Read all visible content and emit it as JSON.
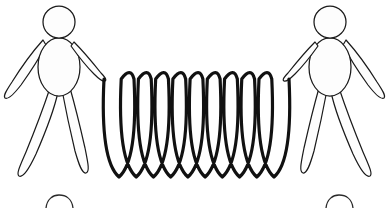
{
  "canvas": {
    "width": 389,
    "height": 208,
    "background_color": "#ffffff",
    "title": "Two figures stretching a coiled spring"
  },
  "style": {
    "outline_color": "#1a1a1a",
    "fill_color": "#fdfdfd",
    "spring_color": "#111111",
    "spring_stroke_width": 3.2,
    "figure_stroke_width": 1.25
  },
  "figures": [
    {
      "id": "left-figure",
      "label": "Left figure",
      "facing": "right",
      "head": {
        "cx": 59,
        "cy": 22,
        "rx": 16,
        "ry": 16
      },
      "torso": {
        "cx": 59,
        "cy": 67,
        "rx": 21,
        "ry": 29
      },
      "arms": [
        {
          "id": "left-figure-far-arm",
          "label": "Far arm",
          "direction": "down-left"
        },
        {
          "id": "left-figure-near-arm",
          "label": "Near arm holding spring",
          "direction": "down-right",
          "holds_spring": true
        }
      ],
      "legs": [
        {
          "id": "left-figure-left-leg",
          "label": "Left leg",
          "direction": "down-left"
        },
        {
          "id": "left-figure-right-leg",
          "label": "Right leg",
          "direction": "down-right"
        }
      ],
      "hand_anchor": {
        "x": 105,
        "y": 80
      }
    },
    {
      "id": "right-figure",
      "label": "Right figure",
      "facing": "left",
      "head": {
        "cx": 330,
        "cy": 22,
        "rx": 16,
        "ry": 16
      },
      "torso": {
        "cx": 330,
        "cy": 67,
        "rx": 21,
        "ry": 29
      },
      "arms": [
        {
          "id": "right-figure-far-arm",
          "label": "Far arm",
          "direction": "down-right"
        },
        {
          "id": "right-figure-near-arm",
          "label": "Near arm holding spring",
          "direction": "down-left",
          "holds_spring": true
        }
      ],
      "legs": [
        {
          "id": "right-figure-left-leg",
          "label": "Left leg",
          "direction": "down-left"
        },
        {
          "id": "right-figure-right-leg",
          "label": "Right leg",
          "direction": "down-right"
        }
      ],
      "hand_anchor": {
        "x": 288,
        "y": 80
      }
    }
  ],
  "spring": {
    "id": "spring-coil",
    "label": "Coiled spring",
    "loop_count": 10,
    "x_start": 104,
    "x_end": 289,
    "y_top": 79,
    "y_bottom": 177,
    "loop_pitch": 20.5,
    "loop_width": 30,
    "color": "#111111"
  },
  "partial_heads": [
    {
      "id": "partial-head-left",
      "label": "Top of head below crop (left)",
      "cx": 59,
      "cy": 212,
      "rx": 14,
      "ry": 12
    },
    {
      "id": "partial-head-right",
      "label": "Top of head below crop (right)",
      "cx": 339,
      "cy": 212,
      "rx": 14,
      "ry": 12
    }
  ]
}
